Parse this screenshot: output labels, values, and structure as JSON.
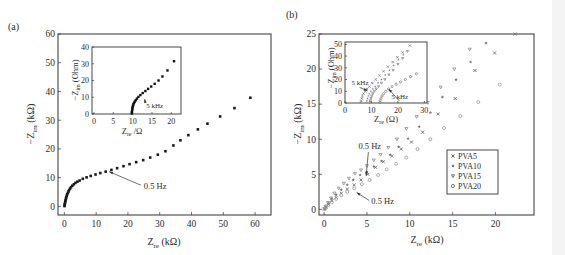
{
  "figure": {
    "panels": [
      "(a)",
      "(b)"
    ]
  },
  "chart_data": [
    {
      "id": "a",
      "panel_label": "(a)",
      "type": "scatter",
      "title": "",
      "xlabel": "Z_re (kΩ)",
      "ylabel": "−Z_im (kΩ)",
      "xlim": [
        -2,
        65
      ],
      "ylim": [
        -3,
        60
      ],
      "xticks": [
        0,
        10,
        20,
        30,
        40,
        50,
        60
      ],
      "yticks": [
        0,
        10,
        20,
        30,
        40,
        50,
        60
      ],
      "grid": false,
      "marker": "square",
      "color": "#1a1a1a",
      "series": [
        {
          "name": "sample",
          "x": [
            0.05,
            0.1,
            0.15,
            0.2,
            0.3,
            0.4,
            0.5,
            0.6,
            0.75,
            0.9,
            1.1,
            1.3,
            1.5,
            1.8,
            2.1,
            2.5,
            3.0,
            3.5,
            4.1,
            4.8,
            5.8,
            7.0,
            8.3,
            9.8,
            11.3,
            13.0,
            14.8,
            16.6,
            18.6,
            20.5,
            22.6,
            24.8,
            27.0,
            29.4,
            31.8,
            34.3,
            36.5,
            39.0,
            42.0,
            45.0,
            49.0,
            53.5,
            58.5
          ],
          "y": [
            0.1,
            0.4,
            0.8,
            1.2,
            1.7,
            2.2,
            2.7,
            3.2,
            3.7,
            4.2,
            4.7,
            5.2,
            5.7,
            6.2,
            6.7,
            7.2,
            7.7,
            8.2,
            8.6,
            9.0,
            9.6,
            10.1,
            10.6,
            11.1,
            11.6,
            12.1,
            12.7,
            13.3,
            14.0,
            14.7,
            15.4,
            16.1,
            17.0,
            18.0,
            19.2,
            21.2,
            23.0,
            24.8,
            26.8,
            28.8,
            31.3,
            34.2,
            37.8
          ]
        }
      ],
      "annotations": [
        {
          "text": "0.5 Hz",
          "arrow_to": [
            13.5,
            12.4
          ],
          "text_at": [
            25,
            6
          ]
        }
      ],
      "inset": {
        "xlabel": "Z_re /Ω",
        "ylabel": "−Z_im (Ohm)",
        "xlim": [
          -0.5,
          22.5
        ],
        "ylim": [
          0,
          40
        ],
        "xticks": [
          0,
          5,
          10,
          15,
          20
        ],
        "yticks": [
          0,
          10,
          20,
          30,
          40
        ],
        "x": [
          9.8,
          9.8,
          9.85,
          9.9,
          9.95,
          10.0,
          10.1,
          10.2,
          10.35,
          10.55,
          10.8,
          11.1,
          11.5,
          12.0,
          12.6,
          13.3,
          14.0,
          14.8,
          15.7,
          16.7,
          17.7,
          19.0,
          20.7
        ],
        "y": [
          0.3,
          1.0,
          1.8,
          2.6,
          3.4,
          4.2,
          5.0,
          5.8,
          6.6,
          7.4,
          8.2,
          9.2,
          10.2,
          11.3,
          12.5,
          13.7,
          15.0,
          16.4,
          18.0,
          20.0,
          22.4,
          26.0,
          31.5
        ],
        "annotations": [
          {
            "text": "5 kHz",
            "arrow_to": [
              12.6,
              9.5
            ],
            "text_at": [
              13.0,
              3.5
            ]
          }
        ]
      }
    },
    {
      "id": "b",
      "panel_label": "(b)",
      "type": "scatter",
      "title": "",
      "xlabel": "Z_re (kΩ)",
      "ylabel": "−Z_im (kΩ)",
      "xlim": [
        -0.6,
        24.5
      ],
      "ylim": [
        -0.8,
        25
      ],
      "xticks": [
        0,
        5,
        10,
        15,
        20
      ],
      "yticks": [
        0,
        5,
        10,
        15,
        20,
        25
      ],
      "grid": false,
      "legend": {
        "position": "lower-right",
        "entries": [
          "PVA5",
          "PVA10",
          "PVA15",
          "PVA20"
        ]
      },
      "series": [
        {
          "name": "PVA5",
          "marker": "x",
          "color": "#6e6e6e",
          "x": [
            0.05,
            0.2,
            0.5,
            0.9,
            1.4,
            2.0,
            2.7,
            3.5,
            4.3,
            5.1,
            6.0,
            6.9,
            7.9,
            9.0,
            10.2,
            11.5,
            13.3,
            15.3,
            17.6,
            19.9,
            22.3
          ],
          "y": [
            0.05,
            0.3,
            0.7,
            1.2,
            1.7,
            2.3,
            2.9,
            3.5,
            4.2,
            5.0,
            6.0,
            6.8,
            7.6,
            8.6,
            9.6,
            11.0,
            13.6,
            15.8,
            19.8,
            22.3,
            25.0
          ]
        },
        {
          "name": "PVA10",
          "marker": "star",
          "color": "#6e6e6e",
          "x": [
            0.05,
            0.2,
            0.5,
            0.9,
            1.4,
            2.0,
            2.7,
            3.4,
            4.2,
            5.0,
            5.8,
            6.7,
            7.7,
            8.7,
            9.8,
            11.1,
            12.4,
            13.8,
            15.4,
            17.1,
            18.9
          ],
          "y": [
            0.1,
            0.4,
            0.9,
            1.5,
            2.1,
            2.8,
            3.5,
            4.2,
            4.9,
            5.4,
            6.1,
            6.9,
            7.8,
            8.9,
            10.1,
            11.8,
            13.8,
            16.0,
            18.5,
            21.0,
            23.7
          ]
        },
        {
          "name": "PVA15",
          "marker": "triangle-down",
          "color": "#8a8a8a",
          "x": [
            0.05,
            0.2,
            0.45,
            0.8,
            1.2,
            1.7,
            2.3,
            2.9,
            3.6,
            4.3,
            5.0,
            5.8,
            6.6,
            7.5,
            8.5,
            9.6,
            10.8,
            12.1,
            13.6,
            15.2,
            17.0
          ],
          "y": [
            0.1,
            0.45,
            0.95,
            1.6,
            2.3,
            3.0,
            3.7,
            4.4,
            5.1,
            5.6,
            6.2,
            7.0,
            7.8,
            8.8,
            10.0,
            11.5,
            13.2,
            15.2,
            17.4,
            20.0,
            22.8
          ]
        },
        {
          "name": "PVA20",
          "marker": "circle",
          "color": "#9a9a9a",
          "x": [
            0.05,
            0.2,
            0.5,
            0.9,
            1.4,
            2.0,
            2.7,
            3.5,
            4.4,
            5.3,
            6.3,
            7.3,
            8.4,
            9.6,
            10.9,
            12.4,
            14.0,
            15.9,
            18.0,
            20.5
          ],
          "y": [
            0.05,
            0.25,
            0.6,
            1.0,
            1.5,
            2.0,
            2.5,
            3.0,
            3.6,
            4.2,
            4.9,
            5.7,
            6.5,
            7.4,
            8.6,
            10.0,
            11.6,
            13.3,
            15.3,
            17.8
          ]
        }
      ],
      "annotations": [
        {
          "text": "0.5 Hz",
          "arrow_to": [
            4.9,
            4.8
          ],
          "text_at": [
            4.0,
            8.6
          ]
        },
        {
          "text": "0.5 Hz",
          "arrow_to": [
            3.8,
            2.4
          ],
          "text_at": [
            5.5,
            0.7
          ]
        }
      ],
      "inset": {
        "xlabel": "Z_re (Ω)",
        "ylabel": "−Z_im (Ohm)",
        "xlim": [
          0,
          31
        ],
        "ylim": [
          0,
          52
        ],
        "xticks": [
          0,
          10,
          20,
          30
        ],
        "yticks": [
          0,
          10,
          20,
          30,
          40,
          50
        ],
        "series": [
          {
            "name": "PVA5",
            "x": [
              6.0,
              6.1,
              6.3,
              6.6,
              7.0,
              7.6,
              8.3,
              9.2,
              10.3,
              11.6,
              13.0,
              14.6,
              16.2,
              18.0,
              19.8,
              21.8,
              24.5
            ],
            "y": [
              0.5,
              2,
              4,
              6,
              8,
              10,
              12,
              14,
              17,
              20,
              23.5,
              27,
              31,
              35,
              39,
              43,
              49
            ]
          },
          {
            "name": "PVA10",
            "x": [
              8.2,
              8.3,
              8.5,
              8.8,
              9.2,
              9.8,
              10.5,
              11.4,
              12.5,
              13.8,
              15.2,
              16.8,
              18.4,
              20.2,
              22.0
            ],
            "y": [
              0.5,
              2,
              4,
              6,
              8,
              10,
              12,
              14,
              17,
              20,
              24,
              28,
              32,
              37,
              41
            ]
          },
          {
            "name": "PVA15",
            "x": [
              9.5,
              9.6,
              9.8,
              10.1,
              10.5,
              11.1,
              11.8,
              12.7,
              13.8,
              15.1,
              16.6,
              18.2,
              20.0,
              21.8,
              23.6
            ],
            "y": [
              0.5,
              2,
              4,
              6,
              8,
              10,
              12,
              14,
              17,
              20,
              24,
              28,
              33,
              38,
              44
            ]
          },
          {
            "name": "PVA20",
            "x": [
              13.2,
              13.3,
              13.6,
              14.0,
              14.6,
              15.4,
              16.5,
              17.8,
              19.3,
              21.0,
              22.8,
              24.8,
              27.0
            ],
            "y": [
              0.5,
              2,
              4,
              6,
              8,
              10,
              12,
              14,
              16,
              18,
              20,
              22.5,
              25
            ]
          }
        ],
        "annotations": [
          {
            "text": "5 kHz",
            "arrow_to": [
              8.5,
              10.5
            ],
            "text_at": [
              2.5,
              15
            ]
          },
          {
            "text": "5 kHz",
            "arrow_to": [
              16.5,
              12.0
            ],
            "text_at": [
              17.5,
              3.5
            ]
          }
        ]
      }
    }
  ]
}
